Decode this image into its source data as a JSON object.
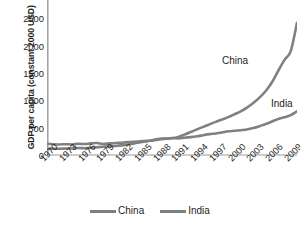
{
  "chart_data": {
    "type": "line",
    "title": "",
    "xlabel": "",
    "ylabel": "GDP per capita (constant 2000 USD)",
    "ylim": [
      0,
      3000
    ],
    "yticks": [
      0,
      500,
      1000,
      1500,
      2000,
      2500,
      3000
    ],
    "ytick_labels": [
      "0",
      "500",
      "1000",
      "1500",
      "2000",
      "2500",
      "3000"
    ],
    "xlim": [
      1970,
      2010
    ],
    "xticks": [
      1970,
      1973,
      1976,
      1979,
      1982,
      1985,
      1988,
      1991,
      1994,
      1997,
      2000,
      2003,
      2006,
      2009
    ],
    "xtick_labels": [
      "1970",
      "1973",
      "1976",
      "1979",
      "1982",
      "1985",
      "1988",
      "1991",
      "1994",
      "1997",
      "2000",
      "2003",
      "2006",
      "2009"
    ],
    "grid": false,
    "legend_position": "bottom",
    "x": [
      1970,
      1971,
      1972,
      1973,
      1974,
      1975,
      1976,
      1977,
      1978,
      1979,
      1980,
      1981,
      1982,
      1983,
      1984,
      1985,
      1986,
      1987,
      1988,
      1989,
      1990,
      1991,
      1992,
      1993,
      1994,
      1995,
      1996,
      1997,
      1998,
      1999,
      2000,
      2001,
      2002,
      2003,
      2004,
      2005,
      2006,
      2007,
      2008,
      2009,
      2010
    ],
    "series": [
      {
        "name": "China",
        "color": "#808080",
        "values": [
          110,
          114,
          114,
          120,
          120,
          127,
          123,
          130,
          142,
          151,
          160,
          165,
          176,
          192,
          212,
          236,
          252,
          274,
          296,
          300,
          307,
          330,
          373,
          420,
          468,
          515,
          560,
          606,
          648,
          692,
          745,
          800,
          868,
          952,
          1050,
          1170,
          1330,
          1540,
          1740,
          1900,
          2420
        ]
      },
      {
        "name": "India",
        "color": "#808080",
        "values": [
          205,
          198,
          193,
          198,
          193,
          205,
          200,
          212,
          219,
          202,
          212,
          220,
          225,
          236,
          243,
          250,
          258,
          267,
          285,
          298,
          310,
          305,
          315,
          327,
          342,
          363,
          382,
          394,
          412,
          434,
          443,
          454,
          466,
          492,
          528,
          566,
          612,
          660,
          690,
          730,
          800
        ]
      }
    ],
    "annotations": [
      {
        "text": "China",
        "series": "China"
      },
      {
        "text": "India",
        "series": "India"
      }
    ],
    "legend": [
      {
        "label": "China",
        "color": "#808080"
      },
      {
        "label": "India",
        "color": "#808080"
      }
    ]
  },
  "axis": {
    "y_title": "GDP per capita (constant 2000 USD)"
  }
}
